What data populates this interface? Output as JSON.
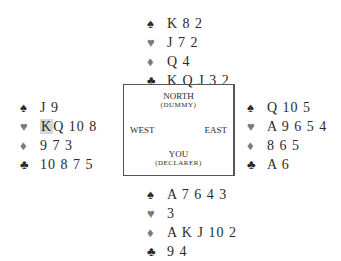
{
  "hands": {
    "north": {
      "spades": "K 8 2",
      "hearts": "J 7 2",
      "diamonds": "Q 4",
      "clubs": "K Q J 3 2"
    },
    "west": {
      "spades": "J 9",
      "hearts_highlighted": "K",
      "hearts_rest": "Q 10 8",
      "diamonds": "9 7 3",
      "clubs": "10 8 7 5"
    },
    "east": {
      "spades": "Q 10 5",
      "hearts": "A 9 6 5 4",
      "diamonds": "8 6 5",
      "clubs": "A 6"
    },
    "south": {
      "spades": "A 7 6 4 3",
      "hearts": "3",
      "diamonds": "A K J 10 2",
      "clubs": "9 4"
    }
  },
  "table": {
    "north": "NORTH",
    "north_role": "(DUMMY)",
    "west": "WEST",
    "east": "EAST",
    "south": "YOU",
    "south_role": "(DECLARER)"
  },
  "icons": {
    "spade": "♠",
    "heart": "♥",
    "diamond": "♦",
    "club": "♣"
  },
  "colors": {
    "black_suit": "#2a2a2a",
    "red_suit": "#7a7a7a",
    "highlight": "#d6d6d6"
  }
}
